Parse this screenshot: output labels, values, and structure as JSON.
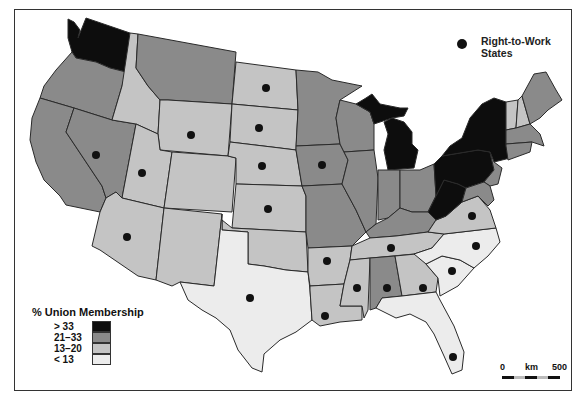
{
  "map": {
    "title": "% Union Membership by State and Right-to-Work States",
    "colors": {
      "gt33": "#0d0d0d",
      "21_33": "#8a8a8a",
      "13_20": "#c4c4c4",
      "lt13": "#ececec",
      "border": "#2a2a2a",
      "water": "#ffffff"
    }
  },
  "legend": {
    "title": "% Union Membership",
    "items": [
      {
        "label": "> 33",
        "color": "#0d0d0d"
      },
      {
        "label": "21–33",
        "color": "#8a8a8a"
      },
      {
        "label": "13–20",
        "color": "#c4c4c4"
      },
      {
        "label": "< 13",
        "color": "#ececec"
      }
    ]
  },
  "right_to_work_legend": {
    "label": "Right-to-Work States",
    "symbol": "filled-circle"
  },
  "scale": {
    "start": "0",
    "unit": "km",
    "end": "500"
  },
  "states": [
    {
      "name": "WA",
      "class": "> 33",
      "rtw": false
    },
    {
      "name": "OR",
      "class": "21–33",
      "rtw": false
    },
    {
      "name": "CA",
      "class": "21–33",
      "rtw": false
    },
    {
      "name": "NV",
      "class": "21–33",
      "rtw": true
    },
    {
      "name": "ID",
      "class": "13–20",
      "rtw": false
    },
    {
      "name": "MT",
      "class": "21–33",
      "rtw": false
    },
    {
      "name": "WY",
      "class": "13–20",
      "rtw": true
    },
    {
      "name": "UT",
      "class": "13–20",
      "rtw": true
    },
    {
      "name": "AZ",
      "class": "13–20",
      "rtw": true
    },
    {
      "name": "CO",
      "class": "13–20",
      "rtw": false
    },
    {
      "name": "NM",
      "class": "13–20",
      "rtw": false
    },
    {
      "name": "ND",
      "class": "13–20",
      "rtw": true
    },
    {
      "name": "SD",
      "class": "13–20",
      "rtw": true
    },
    {
      "name": "NE",
      "class": "13–20",
      "rtw": true
    },
    {
      "name": "KS",
      "class": "13–20",
      "rtw": true
    },
    {
      "name": "OK",
      "class": "13–20",
      "rtw": false
    },
    {
      "name": "TX",
      "class": "< 13",
      "rtw": true
    },
    {
      "name": "MN",
      "class": "21–33",
      "rtw": false
    },
    {
      "name": "IA",
      "class": "21–33",
      "rtw": true
    },
    {
      "name": "MO",
      "class": "21–33",
      "rtw": false
    },
    {
      "name": "AR",
      "class": "13–20",
      "rtw": true
    },
    {
      "name": "LA",
      "class": "13–20",
      "rtw": true
    },
    {
      "name": "WI",
      "class": "21–33",
      "rtw": false
    },
    {
      "name": "IL",
      "class": "21–33",
      "rtw": false
    },
    {
      "name": "MI",
      "class": "> 33",
      "rtw": false
    },
    {
      "name": "IN",
      "class": "21–33",
      "rtw": false
    },
    {
      "name": "OH",
      "class": "21–33",
      "rtw": false
    },
    {
      "name": "KY",
      "class": "21–33",
      "rtw": false
    },
    {
      "name": "TN",
      "class": "13–20",
      "rtw": true
    },
    {
      "name": "MS",
      "class": "13–20",
      "rtw": true
    },
    {
      "name": "AL",
      "class": "21–33",
      "rtw": true
    },
    {
      "name": "GA",
      "class": "13–20",
      "rtw": true
    },
    {
      "name": "FL",
      "class": "< 13",
      "rtw": true
    },
    {
      "name": "SC",
      "class": "< 13",
      "rtw": true
    },
    {
      "name": "NC",
      "class": "< 13",
      "rtw": true
    },
    {
      "name": "VA",
      "class": "13–20",
      "rtw": true
    },
    {
      "name": "WV",
      "class": "> 33",
      "rtw": false
    },
    {
      "name": "PA",
      "class": "> 33",
      "rtw": false
    },
    {
      "name": "NY",
      "class": "> 33",
      "rtw": false
    },
    {
      "name": "NJ",
      "class": "21–33",
      "rtw": false
    },
    {
      "name": "MD",
      "class": "21–33",
      "rtw": false
    },
    {
      "name": "DE",
      "class": "21–33",
      "rtw": false
    },
    {
      "name": "CT",
      "class": "21–33",
      "rtw": false
    },
    {
      "name": "RI",
      "class": "21–33",
      "rtw": false
    },
    {
      "name": "MA",
      "class": "21–33",
      "rtw": false
    },
    {
      "name": "VT",
      "class": "13–20",
      "rtw": false
    },
    {
      "name": "NH",
      "class": "13–20",
      "rtw": false
    },
    {
      "name": "ME",
      "class": "21–33",
      "rtw": false
    }
  ]
}
